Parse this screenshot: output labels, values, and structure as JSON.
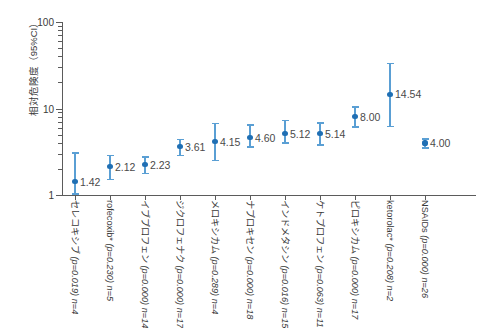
{
  "axes": {
    "ylabel": "相対危険度（95%CI）",
    "y_major_ticks": [
      "100",
      "10",
      "1"
    ]
  },
  "chart_data": {
    "type": "scatter",
    "title": "",
    "xlabel": "",
    "ylabel": "相対危険度（95%CI）",
    "yscale": "log",
    "ylim": [
      1,
      100
    ],
    "grid": false,
    "legend": null,
    "ytick_labels": [
      "100",
      "10",
      "1"
    ],
    "ytick_values": [
      100,
      10,
      1
    ],
    "categories": [
      "セレコキシブ",
      "rofecoxib*",
      "イブプロフェン",
      "ジクロフェナク",
      "メロキシカム",
      "ナプロキセン",
      "インドメタシン",
      "ケトプロフェン",
      "ピロキシカム",
      "ketorolac*",
      "NSAIDs"
    ],
    "points": [
      {
        "label": "セレコキシブ",
        "p": "(p=0.019)",
        "n": "n=4",
        "value": 1.42,
        "value_label": "1.42",
        "ci_low": 1.05,
        "ci_high": 3.1
      },
      {
        "label": "rofecoxib*",
        "p": "(p=0.230)",
        "n": "n=5",
        "value": 2.12,
        "value_label": "2.12",
        "ci_low": 1.55,
        "ci_high": 2.9
      },
      {
        "label": "イブプロフェン",
        "p": "(p=0.000)",
        "n": "n=14",
        "value": 2.23,
        "value_label": "2.23",
        "ci_low": 1.8,
        "ci_high": 2.8
      },
      {
        "label": "ジクロフェナク",
        "p": "(p=0.000)",
        "n": "n=17",
        "value": 3.61,
        "value_label": "3.61",
        "ci_low": 2.9,
        "ci_high": 4.45
      },
      {
        "label": "メロキシカム",
        "p": "(p=0.289)",
        "n": "n=4",
        "value": 4.15,
        "value_label": "4.15",
        "ci_low": 2.55,
        "ci_high": 6.8
      },
      {
        "label": "ナプロキセン",
        "p": "(p=0.000)",
        "n": "n=18",
        "value": 4.6,
        "value_label": "4.60",
        "ci_low": 3.65,
        "ci_high": 6.6
      },
      {
        "label": "インドメタシン",
        "p": "(p=0.016)",
        "n": "n=15",
        "value": 5.12,
        "value_label": "5.12",
        "ci_low": 4.05,
        "ci_high": 7.45
      },
      {
        "label": "ケトプロフェン",
        "p": "(p=0.063)",
        "n": "n=11",
        "value": 5.14,
        "value_label": "5.14",
        "ci_low": 3.85,
        "ci_high": 6.9
      },
      {
        "label": "ピロキシカム",
        "p": "(p=0.000)",
        "n": "n=17",
        "value": 8.0,
        "value_label": "8.00",
        "ci_low": 6.2,
        "ci_high": 10.6
      },
      {
        "label": "ketorolac*",
        "p": "(p=0.208)",
        "n": "n=2",
        "value": 14.54,
        "value_label": "14.54",
        "ci_low": 6.3,
        "ci_high": 34.0
      },
      {
        "label": "NSAIDs",
        "p": "(p=0.000)",
        "n": "n=26",
        "value": 4.0,
        "value_label": "4.00",
        "ci_low": 3.55,
        "ci_high": 4.5
      }
    ]
  },
  "style": {
    "marker_color": "#1f6fb4",
    "whisker_color": "#5a9fd4",
    "axis_color": "#5b5b5b",
    "text_color": "#3a3a3a",
    "background": "#ffffff"
  }
}
